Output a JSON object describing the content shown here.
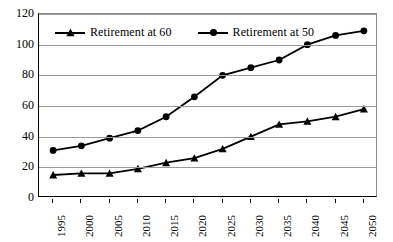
{
  "chart_data": {
    "type": "line",
    "title": "",
    "xlabel": "",
    "ylabel": "",
    "ylim": [
      0,
      120
    ],
    "ytick_step": 20,
    "grid": true,
    "legend_position": "top-left-inside",
    "categories": [
      "1995",
      "2000",
      "2005",
      "2010",
      "2015",
      "2020",
      "2025",
      "2030",
      "2035",
      "2040",
      "2045",
      "2050"
    ],
    "series": [
      {
        "name": "Retirement at 60",
        "marker": "triangle",
        "color": "#000000",
        "values": [
          15,
          16,
          16,
          19,
          23,
          26,
          32,
          40,
          48,
          50,
          53,
          58
        ]
      },
      {
        "name": "Retirement at 50",
        "marker": "circle",
        "color": "#000000",
        "values": [
          31,
          34,
          39,
          44,
          53,
          66,
          80,
          85,
          90,
          100,
          106,
          109
        ]
      }
    ],
    "yticks": [
      "0",
      "20",
      "40",
      "60",
      "80",
      "100",
      "120"
    ]
  },
  "legend": {
    "entries": [
      {
        "label": "Retirement at 60",
        "marker": "triangle-marker-icon"
      },
      {
        "label": "Retirement at 50",
        "marker": "circle-marker-icon"
      }
    ]
  },
  "axes": {
    "y_axis_name": "value-axis",
    "x_axis_name": "year-axis"
  }
}
